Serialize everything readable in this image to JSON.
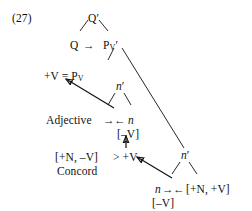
{
  "figure": {
    "example_number": "(27)",
    "type": "syntactic-tree-diagram",
    "background_color": "#ffffff",
    "ink_color": "#111111"
  },
  "nodes": {
    "q_bar": {
      "text": "Q′",
      "x": 88,
      "y": 13
    },
    "q": {
      "text": "Q",
      "x": 70,
      "y": 40
    },
    "pv_bar_p": {
      "text": "P",
      "x": 104,
      "y": 40
    },
    "pv_bar_sub": {
      "text": "V",
      "x": 0,
      "y": 0
    },
    "pv_bar_prime": {
      "text": "′",
      "x": 0,
      "y": 0
    },
    "pv_bar_full": {
      "text": "P",
      "sub": "V",
      "prime": "′"
    },
    "plusv_eq_pv": {
      "text": "+V = P",
      "sub": "V",
      "x": 44,
      "y": 71
    },
    "n_bar_mid": {
      "text": "n",
      "prime": "′",
      "x": 116,
      "y": 86
    },
    "adjective": {
      "text": "Adjective",
      "x": 46,
      "y": 115
    },
    "n_mid": {
      "text": "n",
      "prime": "",
      "x": 130,
      "y": 115
    },
    "minus_v_mid": {
      "text": "[–V]",
      "x": 118,
      "y": 129
    },
    "concord_features": {
      "text": "[+N, –V]",
      "x": 55,
      "y": 152
    },
    "gt_plus_v": {
      "text": "> +V",
      "x": 114,
      "y": 152
    },
    "concord": {
      "text": "Concord",
      "x": 57,
      "y": 166
    },
    "n_bar_right": {
      "text": "n",
      "prime": "′",
      "x": 181,
      "y": 155
    },
    "n_right": {
      "text": "n",
      "prime": "",
      "x": 155,
      "y": 184
    },
    "plusn_plusv": {
      "text": "[+N, +V]",
      "x": 186,
      "y": 184
    },
    "minus_v_right": {
      "text": "[–V]",
      "x": 152,
      "y": 198
    }
  },
  "labels_flat": [
    "(27)",
    "Q′",
    "Q",
    "Pᵥ′",
    "+V = Pᵥ",
    "n′",
    "Adjective",
    "n",
    "[–V]",
    "[+N, –V]",
    "> +V",
    "Concord",
    "n′",
    "n",
    "[+N, +V]",
    "[–V]"
  ],
  "arrows": {
    "q_to_pv": {
      "glyph": "→",
      "x": 84,
      "y": 40,
      "description": "Q points right to P-V-bar"
    },
    "adjective_to_n_right": {
      "glyph": "→",
      "x": 104,
      "y": 115,
      "description": "Adjective points right"
    },
    "n_to_adjective_left": {
      "glyph": "←",
      "x": 117,
      "y": 115,
      "description": "n points left"
    },
    "n_right_arrow": {
      "glyph": "→",
      "x": 163,
      "y": 184,
      "description": "bottom n points right"
    },
    "features_left_arrow": {
      "glyph": "←",
      "x": 176,
      "y": 184,
      "description": "[+N, +V] points left"
    }
  },
  "edges": [
    {
      "name": "qbar-to-q",
      "kind": "branch"
    },
    {
      "name": "qbar-to-pvbar",
      "kind": "branch"
    },
    {
      "name": "pvbar-to-nbar-mid",
      "kind": "branch"
    },
    {
      "name": "pvbar-to-nbar-right",
      "kind": "long-line"
    },
    {
      "name": "nbar-mid-to-adjective",
      "kind": "branch"
    },
    {
      "name": "nbar-mid-to-n",
      "kind": "branch"
    },
    {
      "name": "nbar-right-to-n",
      "kind": "branch"
    },
    {
      "name": "nbar-right-to-features",
      "kind": "branch"
    },
    {
      "name": "n-to-plusv-pv-arrow",
      "kind": "arrow"
    },
    {
      "name": "gtplusv-to-minusv-arrow",
      "kind": "arrow"
    },
    {
      "name": "bottom-n-to-plusv-arrow",
      "kind": "arrow"
    }
  ]
}
